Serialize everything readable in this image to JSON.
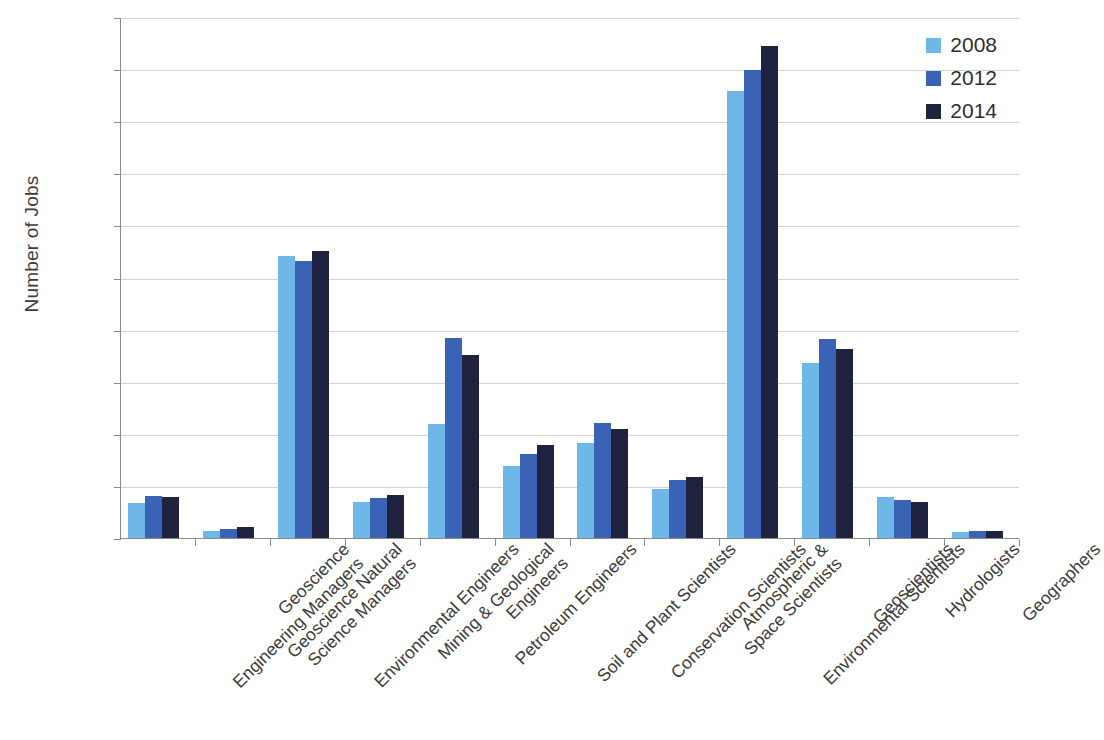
{
  "chart_data": {
    "type": "bar",
    "title": "",
    "xlabel": "",
    "ylabel": "Number of Jobs",
    "ylim": [
      0,
      100000
    ],
    "ytick_labels": [
      "100,000",
      "90,000",
      "80,000",
      "70,000",
      "60,000",
      "50,000",
      "40,000",
      "30,000",
      "20,000",
      "10,000",
      "0"
    ],
    "ytick_values": [
      100000,
      90000,
      80000,
      70000,
      60000,
      50000,
      40000,
      30000,
      20000,
      10000,
      0
    ],
    "grid": true,
    "legend_position": "top-right",
    "categories": [
      "Geoscience Engineering Managers",
      "Geoscience Natural Science Managers",
      "Environmental Engineers",
      "Mining & Geological Engineers",
      "Petroleum Engineers",
      "Soil and Plant Scientists",
      "Conservation Scientists",
      "Atmospheric & Space Scientists",
      "Environmental Scientists",
      "Geoscientists",
      "Hydrologists",
      "Geographers"
    ],
    "category_lines": [
      [
        "Geoscience",
        "Engineering Managers"
      ],
      [
        "Geoscience Natural",
        "Science Managers"
      ],
      [
        "Environmental Engineers",
        ""
      ],
      [
        "Mining & Geological",
        "Engineers"
      ],
      [
        "Petroleum Engineers",
        ""
      ],
      [
        "Soil and Plant Scientists",
        ""
      ],
      [
        "Conservation Scientists",
        ""
      ],
      [
        "Atmospheric &",
        "Space Scientists"
      ],
      [
        "Environmental Scientists",
        ""
      ],
      [
        "Geoscientists",
        ""
      ],
      [
        "Hydrologists",
        ""
      ],
      [
        "Geographers",
        ""
      ]
    ],
    "series": [
      {
        "name": "2008",
        "color": "#6EB8E8",
        "values": [
          7000,
          1500,
          54300,
          7100,
          22000,
          14000,
          18500,
          9600,
          86000,
          33800,
          8000,
          1300
        ]
      },
      {
        "name": "2012",
        "color": "#3A62B5",
        "values": [
          8300,
          2000,
          53300,
          7900,
          38500,
          16400,
          22300,
          11400,
          90000,
          38400,
          7400,
          1600
        ]
      },
      {
        "name": "2014",
        "color": "#1F2340",
        "values": [
          8000,
          2300,
          55200,
          8400,
          35300,
          18000,
          21200,
          11900,
          94600,
          36500,
          7100,
          1500
        ]
      }
    ]
  },
  "colors": {
    "series_2008": "#6EB8E8",
    "series_2012": "#3A62B5",
    "series_2014": "#1F2340",
    "gridline": "#d2d2d2",
    "axis": "#8a8a8a",
    "text": "#2f2f2f",
    "background": "#ffffff"
  }
}
